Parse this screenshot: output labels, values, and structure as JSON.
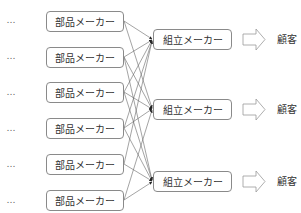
{
  "diagram": {
    "ellipsis": "…",
    "parts": [
      {
        "label": "部品メーカー",
        "y": 11
      },
      {
        "label": "部品メーカー",
        "y": 46
      },
      {
        "label": "部品メーカー",
        "y": 82
      },
      {
        "label": "部品メーカー",
        "y": 118
      },
      {
        "label": "部品メーカー",
        "y": 154
      },
      {
        "label": "部品メーカー",
        "y": 190
      }
    ],
    "assemblers": [
      {
        "label": "組立メーカー",
        "y": 29
      },
      {
        "label": "組立メーカー",
        "y": 99
      },
      {
        "label": "組立メーカー",
        "y": 171
      }
    ],
    "customers": [
      {
        "label": "顧客"
      },
      {
        "label": "顧客"
      },
      {
        "label": "顧客"
      }
    ],
    "colors": {
      "line": "#555555",
      "box_border": "#8a8a8a",
      "arrow": "#999999"
    }
  }
}
